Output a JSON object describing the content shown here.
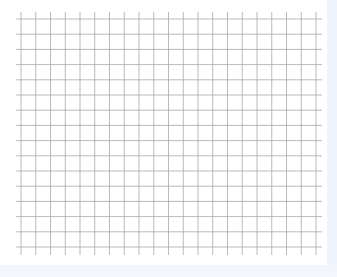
{
  "grid_sheet": {
    "vertical_lines": 21,
    "horizontal_lines": 16,
    "x_start": 21,
    "x_spacing": 14.75,
    "y_start": 19,
    "y_spacing": 15.2,
    "line_color": "#a8a8a8",
    "background": "#ffffff",
    "edge_color": "#eef4fb"
  }
}
